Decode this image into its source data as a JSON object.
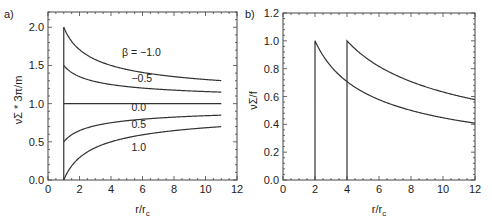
{
  "chart_data": [
    {
      "panel_label": "a)",
      "type": "line",
      "title": "",
      "xlabel": "r/r_c",
      "ylabel": "νΣ * 3π/m",
      "xlim": [
        0,
        12
      ],
      "ylim": [
        0,
        2.2
      ],
      "xticks": [
        0,
        2,
        4,
        6,
        8,
        10,
        12
      ],
      "xtick_labels": [
        "0",
        "2",
        "4",
        "6",
        "8",
        "10",
        "12"
      ],
      "yticks": [
        0.0,
        0.5,
        1.0,
        1.5,
        2.0
      ],
      "ytick_labels": [
        "0.0",
        "0.5",
        "1.0",
        "1.5",
        "2.0"
      ],
      "grid": false,
      "legend": "inline curve labels",
      "x_domain": [
        1,
        11
      ],
      "formula": "1 - beta * sqrt(1/x)",
      "series": [
        {
          "name": "β = −1.0",
          "beta": -1.0,
          "label": "β = −1.0",
          "label_pos": [
            4.7,
            1.62
          ],
          "x": [
            1,
            1.5,
            2,
            3,
            4,
            5,
            6,
            7,
            8,
            9,
            10,
            11
          ],
          "values": [
            2.0,
            1.82,
            1.71,
            1.58,
            1.5,
            1.45,
            1.41,
            1.38,
            1.35,
            1.33,
            1.32,
            1.3
          ]
        },
        {
          "name": "−0.5",
          "beta": -0.5,
          "label": "−0.5",
          "label_pos": [
            5.3,
            1.28
          ],
          "x": [
            1,
            1.5,
            2,
            3,
            4,
            5,
            6,
            7,
            8,
            9,
            10,
            11
          ],
          "values": [
            1.5,
            1.41,
            1.35,
            1.29,
            1.25,
            1.22,
            1.2,
            1.19,
            1.18,
            1.17,
            1.16,
            1.15
          ]
        },
        {
          "name": "0.0",
          "beta": 0.0,
          "label": "0.0",
          "label_pos": [
            5.3,
            0.9
          ],
          "x": [
            1,
            11
          ],
          "values": [
            1.0,
            1.0
          ]
        },
        {
          "name": "0.5",
          "beta": 0.5,
          "label": "0.5",
          "label_pos": [
            5.3,
            0.68
          ],
          "x": [
            1,
            1.5,
            2,
            3,
            4,
            5,
            6,
            7,
            8,
            9,
            10,
            11
          ],
          "values": [
            0.5,
            0.59,
            0.65,
            0.71,
            0.75,
            0.78,
            0.8,
            0.81,
            0.82,
            0.83,
            0.84,
            0.85
          ]
        },
        {
          "name": "1.0",
          "beta": 1.0,
          "label": "1.0",
          "label_pos": [
            5.3,
            0.38
          ],
          "x": [
            1,
            1.5,
            2,
            3,
            4,
            5,
            6,
            7,
            8,
            9,
            10,
            11
          ],
          "values": [
            0.0,
            0.18,
            0.29,
            0.42,
            0.5,
            0.55,
            0.59,
            0.62,
            0.65,
            0.67,
            0.68,
            0.7
          ]
        }
      ],
      "vertical_line": {
        "x": 1,
        "y": [
          0,
          2.0
        ]
      }
    },
    {
      "panel_label": "b)",
      "type": "line",
      "title": "",
      "xlabel": "r/r_c",
      "ylabel": "νΣ/f",
      "xlim": [
        0,
        12
      ],
      "ylim": [
        0,
        1.2
      ],
      "xticks": [
        0,
        2,
        4,
        6,
        8,
        10,
        12
      ],
      "xtick_labels": [
        "0",
        "2",
        "4",
        "6",
        "8",
        "10",
        "12"
      ],
      "yticks": [
        0.0,
        0.2,
        0.4,
        0.6,
        0.8,
        1.0,
        1.2
      ],
      "ytick_labels": [
        "0.0",
        "0.2",
        "0.4",
        "0.6",
        "0.8",
        "1.0",
        "1.2"
      ],
      "grid": false,
      "legend": "none",
      "formula": "sqrt(r0/x) for x >= r0, with vertical drop to 0 at r0",
      "series": [
        {
          "name": "r0 = 2",
          "r0": 2,
          "x": [
            2,
            3,
            4,
            5,
            6,
            7,
            8,
            9,
            10,
            11,
            12
          ],
          "values": [
            1.0,
            0.82,
            0.71,
            0.63,
            0.58,
            0.53,
            0.5,
            0.47,
            0.45,
            0.43,
            0.41
          ]
        },
        {
          "name": "r0 = 4",
          "r0": 4,
          "x": [
            4,
            5,
            6,
            7,
            8,
            9,
            10,
            11,
            12
          ],
          "values": [
            1.0,
            0.89,
            0.82,
            0.76,
            0.71,
            0.67,
            0.63,
            0.6,
            0.58
          ]
        }
      ]
    }
  ],
  "layout": {
    "panels": [
      {
        "x0": 48,
        "x1": 237,
        "y0": 180,
        "y1": 12,
        "label_x": 4,
        "label_y": 18
      },
      {
        "x0": 283,
        "x1": 475,
        "y0": 180,
        "y1": 13,
        "label_x": 245,
        "label_y": 18
      }
    ],
    "line_color": "#333333",
    "axis_color": "#444444"
  }
}
